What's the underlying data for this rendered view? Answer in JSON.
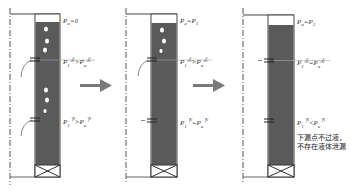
{
  "diagram": {
    "type": "leak-test-process",
    "colors": {
      "liquid": "#5a5a5a",
      "gas_gap": "#ffffff",
      "outline": "#444444",
      "arrow": "#7a7a7a",
      "centerline": "#555555",
      "bubble": "#ffffff"
    },
    "panels": [
      {
        "id": "panel-1",
        "top_label": {
          "p": "P",
          "sub": "a",
          "rest": "=0"
        },
        "upper_label": {
          "lhs": "P",
          "lhs_sub": "1",
          "lhs_sup": "上",
          "op": ">",
          "rhs": "P",
          "rhs_sub": "a",
          "rhs_sup": "上"
        },
        "lower_label": {
          "lhs": "P",
          "lhs_sub": "1",
          "lhs_sup": "下",
          "op": ">",
          "rhs": "P",
          "rhs_sub": "a",
          "rhs_sup": "下"
        },
        "has_bubbles": true,
        "note": ""
      },
      {
        "id": "panel-2",
        "top_label": {
          "p": "P",
          "sub": "a",
          "rest": "=P",
          "rest_sub": "1"
        },
        "upper_label": {
          "lhs": "P",
          "lhs_sub": "1",
          "lhs_sup": "上",
          "op": ">",
          "rhs": "P",
          "rhs_sub": "a",
          "rhs_sup": "上"
        },
        "lower_label": {
          "lhs": "P",
          "lhs_sub": "1",
          "lhs_sup": "下",
          "op": "=",
          "rhs": "P",
          "rhs_sub": "a",
          "rhs_sup": "下"
        },
        "has_bubbles": true,
        "note": ""
      },
      {
        "id": "panel-3",
        "top_label": {
          "p": "P",
          "sub": "a",
          "rest": "=P",
          "rest_sub": "2"
        },
        "upper_label": {
          "lhs": "P",
          "lhs_sub": "1",
          "lhs_sup": "上",
          "op": "=",
          "rhs": "P",
          "rhs_sub": "a",
          "rhs_sup": "上"
        },
        "lower_label": {
          "lhs": "P",
          "lhs_sub": "1",
          "lhs_sup": "下",
          "op": "<",
          "rhs": "P",
          "rhs_sub": "a",
          "rhs_sup": "下"
        },
        "has_bubbles": false,
        "note_line1": "下漏点不过液，",
        "note_line2": "不存在液体泄漏"
      }
    ],
    "arrows": [
      "arrow-1-to-2",
      "arrow-2-to-3"
    ]
  }
}
